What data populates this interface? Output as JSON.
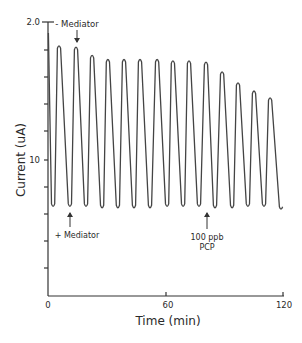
{
  "chart_data": {
    "type": "line",
    "title": "",
    "xlabel": "Time (min)",
    "ylabel": "Current (uA)",
    "xlim": [
      0,
      120
    ],
    "ylim": [
      0,
      20
    ],
    "x_ticks": [
      0,
      60,
      120
    ],
    "x_tick_labels": [
      "0",
      "60",
      "120"
    ],
    "y_ticks": [
      0,
      2,
      4,
      6,
      8,
      10,
      12,
      14,
      16,
      18,
      20
    ],
    "y_tick_labels": {
      "10": "10",
      "20": "2.0"
    },
    "grid": false,
    "legend": null,
    "series": [
      {
        "name": "Current response",
        "peaks": [
          {
            "time": 5.6,
            "value": 18.3
          },
          {
            "time": 14.3,
            "value": 18.2
          },
          {
            "time": 22.5,
            "value": 17.6
          },
          {
            "time": 30.6,
            "value": 17.3
          },
          {
            "time": 38.8,
            "value": 17.3
          },
          {
            "time": 47.0,
            "value": 17.3
          },
          {
            "time": 55.7,
            "value": 17.3
          },
          {
            "time": 63.8,
            "value": 17.2
          },
          {
            "time": 72.0,
            "value": 17.2
          },
          {
            "time": 80.7,
            "value": 17.1
          },
          {
            "time": 88.9,
            "value": 16.4
          },
          {
            "time": 97.0,
            "value": 15.6
          },
          {
            "time": 105.2,
            "value": 15.0
          },
          {
            "time": 113.4,
            "value": 14.5
          }
        ],
        "troughs": [
          {
            "time": 2.6,
            "value": 6.5
          },
          {
            "time": 11.2,
            "value": 6.5
          },
          {
            "time": 19.4,
            "value": 6.5
          },
          {
            "time": 27.6,
            "value": 6.4
          },
          {
            "time": 35.7,
            "value": 6.4
          },
          {
            "time": 43.9,
            "value": 6.4
          },
          {
            "time": 52.1,
            "value": 6.4
          },
          {
            "time": 60.8,
            "value": 6.5
          },
          {
            "time": 69.0,
            "value": 6.5
          },
          {
            "time": 77.1,
            "value": 6.5
          },
          {
            "time": 85.3,
            "value": 6.4
          },
          {
            "time": 94.0,
            "value": 6.4
          },
          {
            "time": 102.1,
            "value": 6.5
          },
          {
            "time": 110.3,
            "value": 6.5
          },
          {
            "time": 119.0,
            "value": 6.3
          }
        ]
      }
    ],
    "annotations": [
      {
        "text": "- Mediator",
        "time": 14.3,
        "position": "above",
        "arrow": "down"
      },
      {
        "text": "+ Mediator",
        "time": 11.2,
        "position": "below",
        "arrow": "up"
      },
      {
        "text": "100 ppb PCP",
        "time": 80.7,
        "position": "below",
        "arrow": "up"
      }
    ]
  },
  "axes": {
    "x_label": "Time (min)",
    "y_label": "Current (uA)",
    "x_tick_0": "0",
    "x_tick_60": "60",
    "x_tick_120": "120",
    "y_tick_top": "2.0",
    "y_tick_mid": "10"
  },
  "annotations": {
    "minus_mediator": "- Mediator",
    "plus_mediator": "+ Mediator",
    "pcp_line1": "100 ppb",
    "pcp_line2": "PCP"
  }
}
